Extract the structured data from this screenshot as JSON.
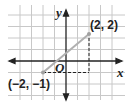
{
  "diagram": {
    "type": "coordinate-plane",
    "axes": {
      "x_label": "x",
      "y_label": "y",
      "origin_label": "O"
    },
    "grid": {
      "x_range": [
        -4,
        4
      ],
      "y_range": [
        -3,
        4
      ],
      "visible": true
    },
    "points": [
      {
        "x": 2,
        "y": 2,
        "label": "(2, 2)"
      },
      {
        "x": -2,
        "y": -1,
        "label": "(−2, −1)"
      }
    ],
    "segment": {
      "from": [
        -2,
        -1
      ],
      "to": [
        2,
        2
      ],
      "color": "#b0b0b0"
    },
    "dashed_guides": [
      {
        "from": [
          -2,
          -1
        ],
        "to": [
          2,
          -1
        ]
      },
      {
        "from": [
          2,
          -1
        ],
        "to": [
          2,
          2
        ]
      }
    ]
  }
}
